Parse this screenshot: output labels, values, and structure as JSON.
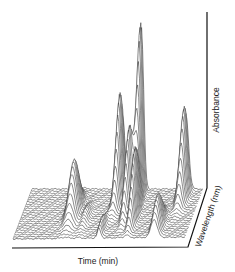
{
  "chart_data": {
    "type": "3d-waterfall",
    "title": "",
    "xlabel": "Time (min)",
    "ylabel": "Absorbance",
    "zlabel": "Wavelength (nm)",
    "grid": false,
    "legend": null,
    "tick_labels": {
      "x": [],
      "y": [],
      "z": []
    },
    "peaks": [
      {
        "time_frac": 0.3,
        "depth_frac": 0.5,
        "height": 0.32,
        "width": 0.022
      },
      {
        "time_frac": 0.38,
        "depth_frac": 0.6,
        "height": 0.06,
        "width": 0.015
      },
      {
        "time_frac": 0.5,
        "depth_frac": 0.85,
        "height": 0.08,
        "width": 0.01
      },
      {
        "time_frac": 0.53,
        "depth_frac": 0.15,
        "height": 0.62,
        "width": 0.014
      },
      {
        "time_frac": 0.61,
        "depth_frac": 0.4,
        "height": 0.48,
        "width": 0.013
      },
      {
        "time_frac": 0.64,
        "depth_frac": 0.05,
        "height": 1.0,
        "width": 0.013
      },
      {
        "time_frac": 0.66,
        "depth_frac": 0.55,
        "height": 0.4,
        "width": 0.012
      },
      {
        "time_frac": 0.82,
        "depth_frac": 0.8,
        "height": 0.2,
        "width": 0.018
      },
      {
        "time_frac": 0.9,
        "depth_frac": 0.1,
        "height": 0.52,
        "width": 0.016
      }
    ],
    "plane": {
      "rows": 24
    }
  }
}
